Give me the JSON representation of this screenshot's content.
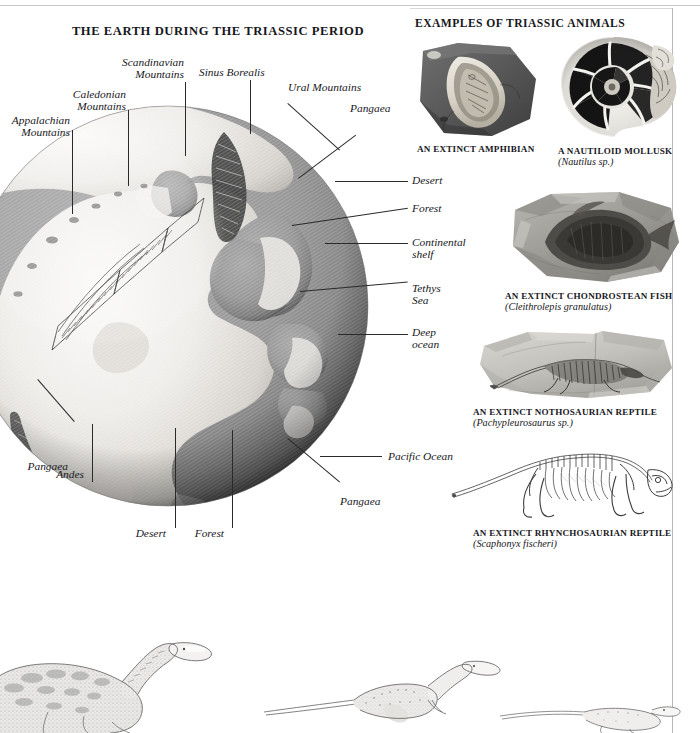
{
  "page": {
    "main_title": "THE EARTH DURING THE TRIASSIC PERIOD",
    "column_title": "EXAMPLES OF TRIASSIC ANIMALS"
  },
  "globe": {
    "name": "triassic-earth-globe",
    "labels": [
      {
        "key": "appalachian",
        "text": "Appalachian\nMountains",
        "align": "right"
      },
      {
        "key": "caledonian",
        "text": "Caledonian\nMountains",
        "align": "right"
      },
      {
        "key": "scandinavian",
        "text": "Scandinavian\nMountains",
        "align": "right"
      },
      {
        "key": "sinus",
        "text": "Sinus Borealis",
        "align": "left"
      },
      {
        "key": "ural",
        "text": "Ural Mountains",
        "align": "left"
      },
      {
        "key": "pangaea_ne",
        "text": "Pangaea",
        "align": "left"
      },
      {
        "key": "desert_e",
        "text": "Desert",
        "align": "left"
      },
      {
        "key": "forest_e",
        "text": "Forest",
        "align": "left"
      },
      {
        "key": "shelf",
        "text": "Continental\nshelf",
        "align": "left"
      },
      {
        "key": "tethys",
        "text": "Tethys\nSea",
        "align": "left"
      },
      {
        "key": "deep",
        "text": "Deep\nocean",
        "align": "left"
      },
      {
        "key": "pacific",
        "text": "Pacific Ocean",
        "align": "left"
      },
      {
        "key": "pangaea_s",
        "text": "Pangaea",
        "align": "left"
      },
      {
        "key": "pangaea_w",
        "text": "Pangaea",
        "align": "right"
      },
      {
        "key": "andes",
        "text": "Andes",
        "align": "right"
      },
      {
        "key": "desert_s",
        "text": "Desert",
        "align": "right"
      },
      {
        "key": "forest_s",
        "text": "Forest",
        "align": "right"
      }
    ]
  },
  "specimens": [
    {
      "key": "amphibian",
      "icon": "fossil-slab-icon",
      "caption": "AN EXTINCT AMPHIBIAN",
      "species": ""
    },
    {
      "key": "nautiloid",
      "icon": "nautilus-shell-icon",
      "caption": "A NAUTILOID MOLLUSK",
      "species": "(Nautilus sp.)"
    },
    {
      "key": "chondrostean-fish",
      "icon": "fossil-slab-icon",
      "caption": "AN EXTINCT CHONDROSTEAN FISH",
      "species": "(Cleithrolepis granulatus)"
    },
    {
      "key": "nothosaur",
      "icon": "fossil-slab-icon",
      "caption": "AN EXTINCT NOTHOSAURIAN REPTILE",
      "species": "(Pachypleurosaurus sp.)"
    },
    {
      "key": "rhynchosaur",
      "icon": "skeleton-icon",
      "caption": "AN EXTINCT RHYNCHOSAURIAN REPTILE",
      "species": "(Scaphonyx fischeri)"
    }
  ],
  "bottom_figures": [
    {
      "key": "prosauropod-left",
      "icon": "prosauropod-dinosaur-icon"
    },
    {
      "key": "theropod-center",
      "icon": "theropod-dinosaur-icon"
    },
    {
      "key": "small-reptile-right",
      "icon": "small-reptile-icon"
    }
  ],
  "colors": {
    "ink": "#17171b",
    "leader": "#2a2a2a",
    "rule": "#c9c9c9",
    "ocean_light": "#9a9a9a",
    "ocean_dark": "#6e6e6e",
    "land_light": "#eceae6",
    "land_mid": "#cfccc6",
    "globe_limb": "#4a4a4a"
  }
}
